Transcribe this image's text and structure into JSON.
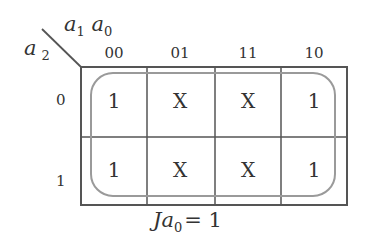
{
  "kmap": {
    "row_var": "a",
    "row_var_sub": "2",
    "col_var_1": "a",
    "col_var_1_sub": "1",
    "col_var_2": "a",
    "col_var_2_sub": "0",
    "columns": [
      "00",
      "01",
      "11",
      "10"
    ],
    "rows": [
      "0",
      "1"
    ],
    "cells": [
      [
        "1",
        "X",
        "X",
        "1"
      ],
      [
        "1",
        "X",
        "X",
        "1"
      ]
    ],
    "grouping": "all cells (single loop covering entire map)",
    "colors": {
      "grid": "#555555",
      "loop": "#999999",
      "text": "#333333"
    }
  },
  "caption": {
    "J": "J",
    "a": "a",
    "sub": "0",
    "rest": "= 1"
  }
}
